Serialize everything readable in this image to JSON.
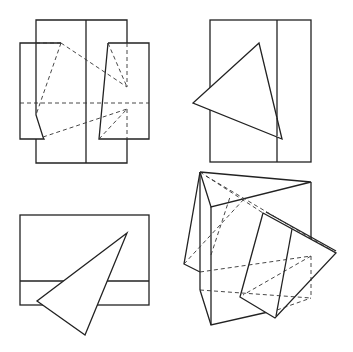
{
  "figure": {
    "colors": {
      "line": "#222222",
      "background": "#ffffff"
    },
    "views": [
      {
        "name": "front-view",
        "label": ""
      },
      {
        "name": "side-view",
        "label": ""
      },
      {
        "name": "top-view",
        "label": ""
      },
      {
        "name": "isometric-view",
        "label": ""
      }
    ]
  }
}
